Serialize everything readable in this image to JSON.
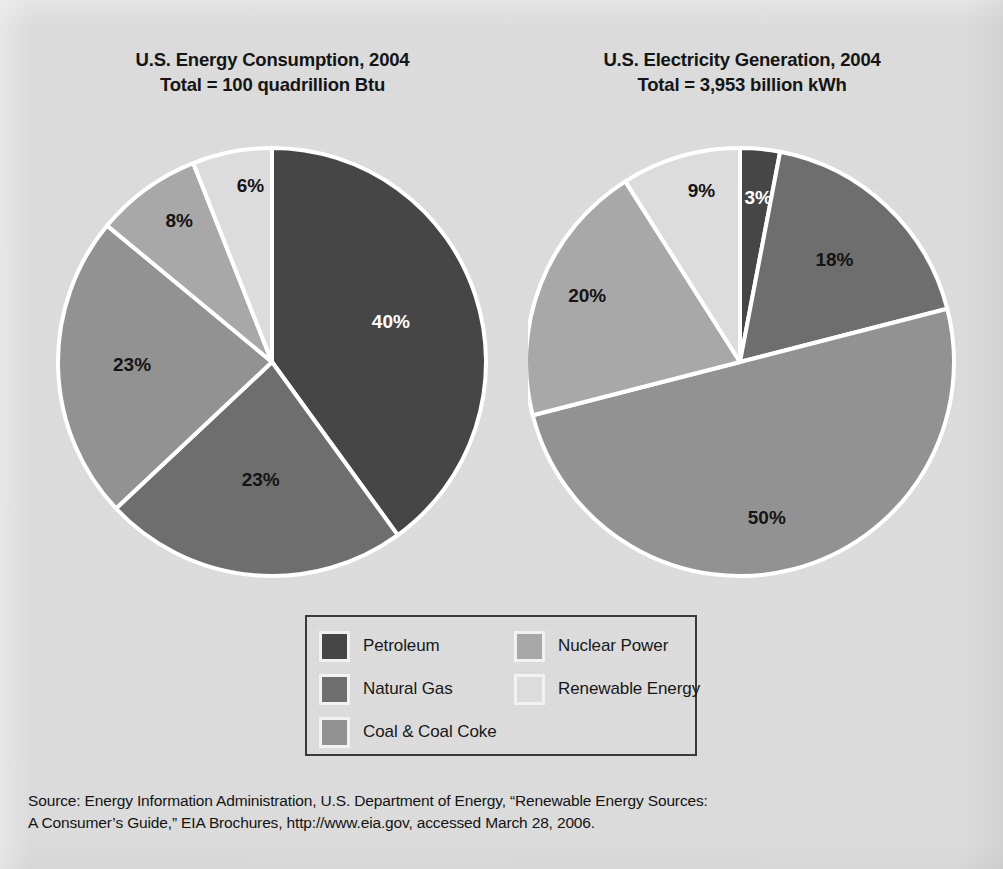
{
  "figure": {
    "background_color": "#dcdddc",
    "source_note_line1": "Source: Energy Information Administration, U.S. Department of Energy, “Renewable Energy Sources:",
    "source_note_line2": "A Consumer’s Guide,” EIA Brochures, http://www.eia.gov, accessed March 28, 2006."
  },
  "legend": {
    "items": [
      {
        "label": "Petroleum",
        "color": "#464646"
      },
      {
        "label": "Natural Gas",
        "color": "#6e6e6e"
      },
      {
        "label": "Coal & Coal Coke",
        "color": "#929292"
      },
      {
        "label": "Nuclear Power",
        "color": "#a8a8a8"
      },
      {
        "label": "Renewable Energy",
        "color": "#dcdcdc"
      }
    ]
  },
  "chart_data": [
    {
      "type": "pie",
      "id": "energy-consumption",
      "title": "U.S. Energy Consumption, 2004",
      "subtitle": "Total = 100 quadrillion Btu",
      "units": "quadrillion Btu",
      "total": "100",
      "categories": [
        "Petroleum",
        "Natural Gas",
        "Coal & Coal Coke",
        "Nuclear Power",
        "Renewable Energy"
      ],
      "values": [
        40,
        23,
        23,
        8,
        6
      ],
      "labels": [
        "40%",
        "23%",
        "23%",
        "8%",
        "6%"
      ],
      "colors": [
        "#464646",
        "#6e6e6e",
        "#929292",
        "#a8a8a8",
        "#dcdcdc"
      ],
      "label_text_colors": [
        "#ffffff",
        "#141414",
        "#141414",
        "#141414",
        "#141414"
      ],
      "start_angle_deg": 0,
      "direction": "clockwise",
      "slice_border_color": "#ffffff",
      "legend_position": "bottom-center"
    },
    {
      "type": "pie",
      "id": "electricity-generation",
      "title": "U.S. Electricity Generation, 2004",
      "subtitle": "Total = 3,953 billion kWh",
      "units": "billion kWh",
      "total": "3,953",
      "categories": [
        "Petroleum",
        "Natural Gas",
        "Coal & Coal Coke",
        "Nuclear Power",
        "Renewable Energy"
      ],
      "values": [
        3,
        18,
        50,
        20,
        9
      ],
      "labels": [
        "3%",
        "18%",
        "50%",
        "20%",
        "9%"
      ],
      "colors": [
        "#464646",
        "#6e6e6e",
        "#929292",
        "#a8a8a8",
        "#dcdcdc"
      ],
      "label_text_colors": [
        "#ffffff",
        "#141414",
        "#141414",
        "#141414",
        "#141414"
      ],
      "start_angle_deg": 0,
      "direction": "clockwise",
      "slice_border_color": "#ffffff",
      "legend_position": "bottom-center"
    }
  ]
}
